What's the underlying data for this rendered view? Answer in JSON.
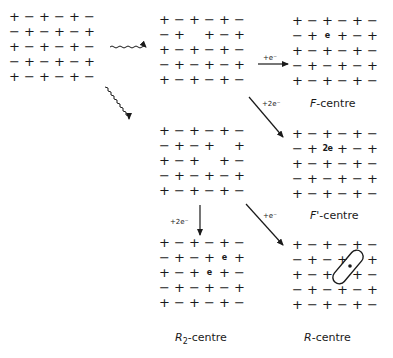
{
  "lattices": {
    "perfect": {
      "rows": [
        [
          "+",
          "−",
          "+",
          "−",
          "+",
          "−"
        ],
        [
          "−",
          "+",
          "−",
          "+",
          "−",
          "+"
        ],
        [
          "+",
          "−",
          "+",
          "−",
          "+",
          "−"
        ],
        [
          "−",
          "+",
          "−",
          "+",
          "−",
          "+"
        ],
        [
          "+",
          "−",
          "+",
          "−",
          "+",
          "−"
        ]
      ]
    },
    "single_vacancy": {
      "rows": [
        [
          "+",
          "−",
          "+",
          "−",
          "+",
          "−"
        ],
        [
          "−",
          "+",
          " ",
          "+",
          "−",
          "+"
        ],
        [
          "+",
          "−",
          "+",
          "−",
          "+",
          "−"
        ],
        [
          "−",
          "+",
          "−",
          "+",
          "−",
          "+"
        ],
        [
          "+",
          "−",
          "+",
          "−",
          "+",
          "−"
        ]
      ]
    },
    "f_centre": {
      "rows": [
        [
          "+",
          "−",
          "+",
          "−",
          "+",
          "−"
        ],
        [
          "−",
          "+",
          "e",
          "+",
          "−",
          "+"
        ],
        [
          "+",
          "−",
          "+",
          "−",
          "+",
          "−"
        ],
        [
          "−",
          "+",
          "−",
          "+",
          "−",
          "+"
        ],
        [
          "+",
          "−",
          "+",
          "−",
          "+",
          "−"
        ]
      ]
    },
    "double_vacancy": {
      "rows": [
        [
          "+",
          "−",
          "+",
          "−",
          "+",
          "−"
        ],
        [
          "−",
          "+",
          "−",
          "+",
          " ",
          "+"
        ],
        [
          "+",
          "−",
          "+",
          " ",
          "+",
          "−"
        ],
        [
          "−",
          "+",
          "−",
          "+",
          "−",
          "+"
        ],
        [
          "+",
          "−",
          "+",
          "−",
          "+",
          "−"
        ]
      ]
    },
    "f_prime_centre": {
      "rows": [
        [
          "+",
          "−",
          "+",
          "−",
          "+",
          "−"
        ],
        [
          "−",
          "+",
          "2e",
          "+",
          "−",
          "+"
        ],
        [
          "+",
          "−",
          "+",
          "−",
          "+",
          "−"
        ],
        [
          "−",
          "+",
          "−",
          "+",
          "−",
          "+"
        ],
        [
          "+",
          "−",
          "+",
          "−",
          "+",
          "−"
        ]
      ]
    },
    "r2_centre": {
      "rows": [
        [
          "+",
          "−",
          "+",
          "−",
          "+",
          "−"
        ],
        [
          "−",
          "+",
          "−",
          "+",
          "e",
          "+"
        ],
        [
          "+",
          "−",
          "+",
          "e",
          "+",
          "−"
        ],
        [
          "−",
          "+",
          "−",
          "+",
          "−",
          "+"
        ],
        [
          "+",
          "−",
          "+",
          "−",
          "+",
          "−"
        ]
      ]
    },
    "r_centre": {
      "rows": [
        [
          "+",
          "−",
          "+",
          "−",
          "+",
          "−"
        ],
        [
          "−",
          "+",
          "−",
          "+",
          " ",
          "+"
        ],
        [
          "+",
          "−",
          "+",
          " ",
          "+",
          "−"
        ],
        [
          "−",
          "+",
          "−",
          "+",
          "−",
          "+"
        ],
        [
          "+",
          "−",
          "+",
          "−",
          "+",
          "−"
        ]
      ],
      "enclosed_electron": "e"
    }
  },
  "arrows": {
    "to_f_centre": "+e⁻",
    "to_f_prime_centre": "+2e⁻",
    "to_r2_centre": "+2e⁻",
    "to_r_centre": "+e⁻"
  },
  "labels": {
    "f_centre": {
      "italic": "F",
      "rest": "-centre"
    },
    "f_prime_centre": {
      "italic": "F'",
      "rest": "-centre"
    },
    "r2_centre": {
      "italic": "R",
      "sub": "2",
      "rest": "-centre"
    },
    "r_centre": {
      "italic": "R",
      "rest": "-centre"
    }
  },
  "colors": {
    "ink": "#1a1a1a",
    "background": "#ffffff"
  }
}
